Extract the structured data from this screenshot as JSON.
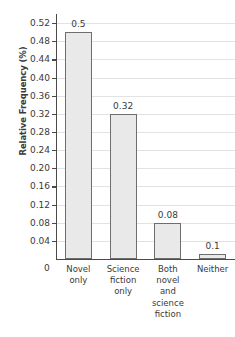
{
  "chart_data": {
    "type": "bar",
    "title": "",
    "xlabel": "",
    "ylabel": "Relative Frequency (%)",
    "categories": [
      "Novel only",
      "Science fiction only",
      "Both novel and science fiction",
      "Neither"
    ],
    "values": [
      0.5,
      0.32,
      0.08,
      0.1
    ],
    "value_labels": [
      "0.5",
      "0.32",
      "0.08",
      "0.1"
    ],
    "drawn_heights": [
      0.5,
      0.32,
      0.08,
      0.012
    ],
    "ylim": [
      0,
      0.54
    ],
    "ytick_labels": [
      "0.04",
      "0.08",
      "0.12",
      "0.16",
      "0.20",
      "0.24",
      "0.28",
      "0.32",
      "0.36",
      "0.40",
      "0.44",
      "0.48",
      "0.52"
    ],
    "ytick_values": [
      0.04,
      0.08,
      0.12,
      0.16,
      0.2,
      0.24,
      0.28,
      0.32,
      0.36,
      0.4,
      0.44,
      0.48,
      0.52
    ],
    "origin_label": "0",
    "grid": true,
    "legend": null,
    "bar_color": "#e9e9e9",
    "bar_border_color": "#6e6e6e",
    "grid_color": "#e2e2e2",
    "axis_color": "#4a4a4a"
  },
  "category_lines": [
    [
      "Novel",
      "only"
    ],
    [
      "Science",
      "fiction",
      "only"
    ],
    [
      "Both",
      "novel",
      "and",
      "science",
      "fiction"
    ],
    [
      "Neither"
    ]
  ]
}
